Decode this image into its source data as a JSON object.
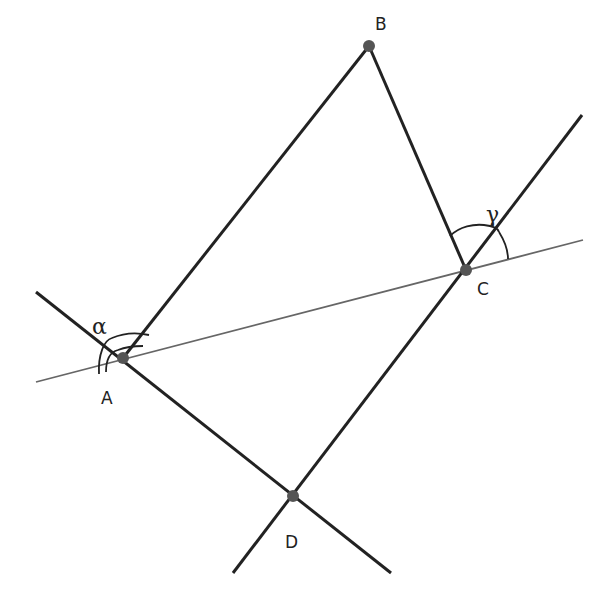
{
  "figure": {
    "width": 612,
    "height": 606,
    "background": "#ffffff",
    "stroke_color": "#222222",
    "thin_stroke_color": "#666666",
    "point_color": "#555555"
  },
  "points": {
    "A": {
      "label": "A",
      "x": 123,
      "y": 358
    },
    "B": {
      "label": "B",
      "x": 369,
      "y": 46
    },
    "C": {
      "label": "C",
      "x": 466,
      "y": 270
    },
    "D": {
      "label": "D",
      "x": 293,
      "y": 496
    }
  },
  "angles": {
    "alpha": {
      "label": "α",
      "at": "A"
    },
    "gamma": {
      "label": "γ",
      "at": "C"
    }
  },
  "segments": [
    {
      "name": "AB",
      "from": "A",
      "to": "B"
    },
    {
      "name": "BC",
      "from": "B",
      "to": "C"
    }
  ],
  "lines": [
    {
      "name": "line-AC",
      "through": [
        "A",
        "C"
      ],
      "style": "thin"
    },
    {
      "name": "line-AD",
      "through": [
        "A",
        "D"
      ],
      "style": "thick"
    },
    {
      "name": "line-CD",
      "through": [
        "C",
        "D"
      ],
      "style": "thick"
    }
  ]
}
